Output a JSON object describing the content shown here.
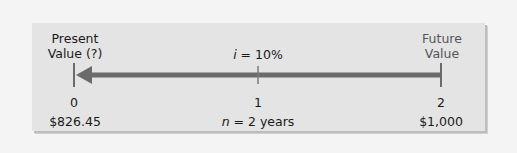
{
  "diagram": {
    "type": "timeline",
    "left_label": {
      "line1": "Present",
      "line2": "Value (?)"
    },
    "right_label": {
      "line1": "Future",
      "line2": "Value"
    },
    "rate_label": {
      "var": "i",
      "rest": " = 10%"
    },
    "periods": [
      "0",
      "1",
      "2"
    ],
    "values": {
      "present": "$826.45",
      "future": "$1,000"
    },
    "term_label": {
      "var": "n",
      "rest": " = 2 years"
    },
    "arrow_direction": "left",
    "colors": {
      "background": "#f4f4f4",
      "panel": "#e4e4e4",
      "arrow": "#6b6b6b",
      "text": "#1a1a1a",
      "future_text": "#555555"
    }
  }
}
